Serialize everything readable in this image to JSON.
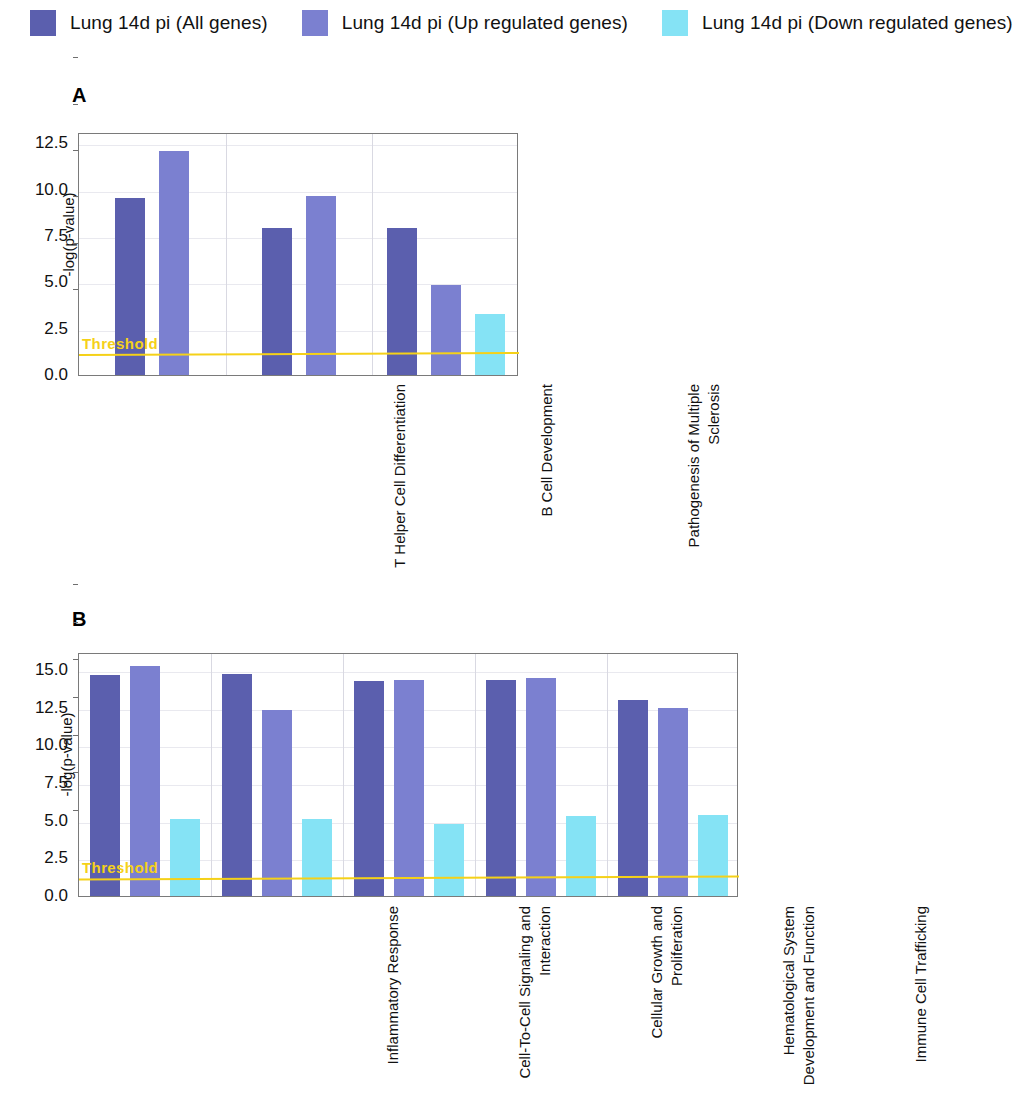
{
  "legend": {
    "items": [
      {
        "label": "Lung 14d pi (All genes)",
        "color": "#5b5fae"
      },
      {
        "label": "Lung 14d pi (Up regulated genes)",
        "color": "#7b80d0"
      },
      {
        "label": "Lung 14d pi (Down regulated genes)",
        "color": "#85e3f5"
      }
    ]
  },
  "panels": [
    {
      "letter": "A"
    },
    {
      "letter": "B"
    }
  ],
  "chart_data": [
    {
      "type": "bar",
      "panel": "A",
      "title": "A",
      "xlabel": "",
      "ylabel": "-log(p-value)",
      "ylim": [
        0,
        13.1
      ],
      "yticks": [
        0.0,
        2.5,
        5.0,
        7.5,
        10.0,
        12.5
      ],
      "ytick_labels": [
        "0.0",
        "2.5",
        "5.0",
        "7.5",
        "10.0",
        "12.5"
      ],
      "grid": true,
      "legend_position": "top",
      "threshold": {
        "value": 1.3,
        "label": "Threshold",
        "color": "#f5d118"
      },
      "categories": [
        "T Helper Cell Differentiation",
        "B Cell Development",
        "Pathogenesis of Multiple\nSclerosis"
      ],
      "series": [
        {
          "name": "Lung 14d pi (All genes)",
          "color": "#5b5fae",
          "values": [
            9.55,
            7.95,
            7.9
          ]
        },
        {
          "name": "Lung 14d pi (Up regulated genes)",
          "color": "#7b80d0",
          "values": [
            12.05,
            9.65,
            4.85
          ]
        },
        {
          "name": "Lung 14d pi (Down regulated genes)",
          "color": "#85e3f5",
          "values": [
            null,
            null,
            3.3
          ]
        }
      ]
    },
    {
      "type": "bar",
      "panel": "B",
      "title": "B",
      "xlabel": "",
      "ylabel": "-log(p-value)",
      "ylim": [
        0,
        16.2
      ],
      "yticks": [
        0.0,
        2.5,
        5.0,
        7.5,
        10.0,
        12.5,
        15.0
      ],
      "ytick_labels": [
        "0.0",
        "2.5",
        "5.0",
        "7.5",
        "10.0",
        "12.5",
        "15.0"
      ],
      "grid": true,
      "legend_position": "top",
      "threshold": {
        "value": 1.4,
        "label": "Threshold",
        "color": "#f5d118"
      },
      "categories": [
        "Inflammatory Response",
        "Cell-To-Cell Signaling and\nInteraction",
        "Cellular Growth and\nProliferation",
        "Hematological System\nDevelopment and Function",
        "Immune Cell Trafficking"
      ],
      "series": [
        {
          "name": "Lung 14d pi (All genes)",
          "color": "#5b5fae",
          "values": [
            14.65,
            14.75,
            14.3,
            14.35,
            13.0
          ]
        },
        {
          "name": "Lung 14d pi (Up regulated genes)",
          "color": "#7b80d0",
          "values": [
            15.25,
            12.35,
            14.35,
            14.45,
            12.45
          ]
        },
        {
          "name": "Lung 14d pi (Down regulated genes)",
          "color": "#85e3f5",
          "values": [
            5.1,
            5.1,
            4.8,
            5.3,
            5.35
          ]
        }
      ]
    }
  ]
}
